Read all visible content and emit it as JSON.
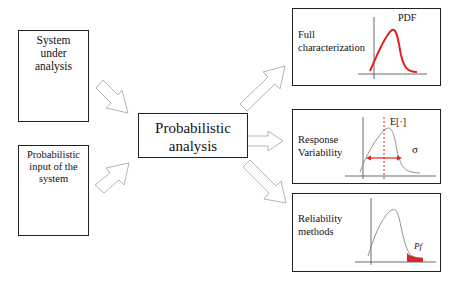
{
  "diagram": {
    "inputs": [
      {
        "id": "system",
        "label_lines": [
          "System",
          "under",
          "analysis"
        ]
      },
      {
        "id": "input",
        "label_lines": [
          "Probabilistic",
          "input of the",
          "system"
        ]
      }
    ],
    "center": {
      "label_lines": [
        "Probabilistic",
        "analysis"
      ]
    },
    "outputs": [
      {
        "id": "full",
        "label_lines": [
          "Full",
          "characterization"
        ],
        "chart_label": "PDF",
        "curve_color": "#e02020"
      },
      {
        "id": "variability",
        "label_lines": [
          "Response",
          "Variability"
        ],
        "mean_label": "E[·]",
        "sigma_label": "σ",
        "marker_color": "#e02020"
      },
      {
        "id": "reliability",
        "label_lines": [
          "Reliability",
          "methods"
        ],
        "tail_label": "Pf",
        "tail_color": "#d42a2a"
      }
    ],
    "colors": {
      "box_border": "#222222",
      "arrow_outline": "#b0b0b0",
      "curve_gray": "#9a9a9a",
      "accent_red": "#e02020"
    }
  }
}
